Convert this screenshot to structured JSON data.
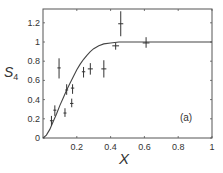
{
  "chart_data": {
    "type": "scatter",
    "title": "",
    "panel_label": "(a)",
    "xlabel": "X",
    "ylabel": "S4",
    "ylabel_main": "S",
    "ylabel_sub": "4",
    "xlim": [
      0,
      1
    ],
    "ylim": [
      0,
      1.35
    ],
    "xticks": [
      0.2,
      0.4,
      0.6,
      0.8,
      1
    ],
    "xtick_labels": [
      "0.2",
      "0.4",
      "0.6",
      "0.8",
      "1"
    ],
    "yticks": [
      0,
      0.2,
      0.4,
      0.6,
      0.8,
      1,
      1.2
    ],
    "ytick_labels": [
      "0",
      "0.2",
      "0.4",
      "0.6",
      "0.8",
      "1",
      "1.2"
    ],
    "grid": false,
    "legend": null,
    "series": [
      {
        "name": "measured",
        "style": "errorbar-cross",
        "points": [
          {
            "x": 0.05,
            "y": 0.18,
            "ylo": 0.13,
            "yhi": 0.23,
            "xerr": 0.0
          },
          {
            "x": 0.07,
            "y": 0.29,
            "ylo": 0.23,
            "yhi": 0.34,
            "xerr": 0.0
          },
          {
            "x": 0.095,
            "y": 0.73,
            "ylo": 0.62,
            "yhi": 0.83,
            "xerr": 0.01
          },
          {
            "x": 0.13,
            "y": 0.26,
            "ylo": 0.22,
            "yhi": 0.31,
            "xerr": 0.0
          },
          {
            "x": 0.14,
            "y": 0.5,
            "ylo": 0.45,
            "yhi": 0.56,
            "xerr": 0.008
          },
          {
            "x": 0.17,
            "y": 0.36,
            "ylo": 0.32,
            "yhi": 0.41,
            "xerr": 0.01
          },
          {
            "x": 0.175,
            "y": 0.52,
            "ylo": 0.46,
            "yhi": 0.56,
            "xerr": 0.01
          },
          {
            "x": 0.24,
            "y": 0.69,
            "ylo": 0.63,
            "yhi": 0.74,
            "xerr": 0.01
          },
          {
            "x": 0.28,
            "y": 0.72,
            "ylo": 0.66,
            "yhi": 0.78,
            "xerr": 0.015
          },
          {
            "x": 0.36,
            "y": 0.72,
            "ylo": 0.63,
            "yhi": 0.81,
            "xerr": 0.015
          },
          {
            "x": 0.43,
            "y": 0.96,
            "ylo": 0.92,
            "yhi": 0.99,
            "xerr": 0.02
          },
          {
            "x": 0.46,
            "y": 1.19,
            "ylo": 1.06,
            "yhi": 1.32,
            "xerr": 0.015
          },
          {
            "x": 0.61,
            "y": 0.99,
            "ylo": 0.94,
            "yhi": 1.05,
            "xerr": 0.02
          }
        ]
      },
      {
        "name": "fit",
        "style": "line",
        "points": [
          {
            "x": 0.0,
            "y": 0.0
          },
          {
            "x": 0.02,
            "y": 0.03
          },
          {
            "x": 0.04,
            "y": 0.09
          },
          {
            "x": 0.06,
            "y": 0.17
          },
          {
            "x": 0.08,
            "y": 0.25
          },
          {
            "x": 0.1,
            "y": 0.34
          },
          {
            "x": 0.12,
            "y": 0.42
          },
          {
            "x": 0.14,
            "y": 0.5
          },
          {
            "x": 0.16,
            "y": 0.57
          },
          {
            "x": 0.18,
            "y": 0.64
          },
          {
            "x": 0.2,
            "y": 0.71
          },
          {
            "x": 0.22,
            "y": 0.77
          },
          {
            "x": 0.24,
            "y": 0.82
          },
          {
            "x": 0.26,
            "y": 0.86
          },
          {
            "x": 0.28,
            "y": 0.9
          },
          {
            "x": 0.3,
            "y": 0.93
          },
          {
            "x": 0.33,
            "y": 0.96
          },
          {
            "x": 0.36,
            "y": 0.98
          },
          {
            "x": 0.4,
            "y": 0.99
          },
          {
            "x": 0.45,
            "y": 1.0
          },
          {
            "x": 0.55,
            "y": 1.0
          },
          {
            "x": 0.7,
            "y": 1.0
          },
          {
            "x": 1.0,
            "y": 1.0
          }
        ]
      }
    ]
  },
  "colors": {
    "axis": "#555555",
    "data": "#333333",
    "curve": "#444444",
    "background": "#ffffff"
  }
}
